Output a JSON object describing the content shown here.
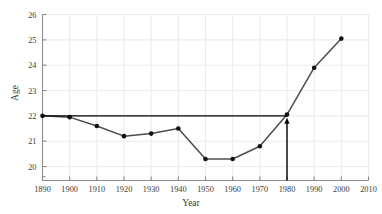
{
  "chart_data": {
    "type": "line",
    "title": "",
    "xlabel": "Year",
    "ylabel": "Age",
    "xlim": [
      1890,
      2010
    ],
    "ylim": [
      19.45,
      26
    ],
    "grid": true,
    "legend": "none",
    "x": [
      1890,
      1900,
      1910,
      1920,
      1930,
      1940,
      1950,
      1960,
      1970,
      1980,
      1990,
      2000
    ],
    "values": [
      22.0,
      21.95,
      21.6,
      21.2,
      21.3,
      21.5,
      20.3,
      20.3,
      20.8,
      22.05,
      23.9,
      25.05
    ],
    "series": [
      {
        "name": "Age",
        "values": [
          22.0,
          21.95,
          21.6,
          21.2,
          21.3,
          21.5,
          20.3,
          20.3,
          20.8,
          22.05,
          23.9,
          25.05
        ],
        "color": "#4d4d4d",
        "marker": "filled-circle",
        "marker_color": "#111111"
      }
    ],
    "xticks": [
      1890,
      1900,
      1910,
      1920,
      1930,
      1940,
      1950,
      1960,
      1970,
      1980,
      1990,
      2000,
      2010
    ],
    "xticklabels": [
      "1890",
      "1900",
      "1910",
      "1920",
      "1930",
      "1940",
      "1950",
      "1960",
      "1970",
      "1980",
      "1990",
      "2000",
      "2010"
    ],
    "yticks": [
      20,
      21,
      22,
      23,
      24,
      25,
      26
    ],
    "yticklabels": [
      "20",
      "21",
      "22",
      "23",
      "24",
      "25",
      "26"
    ],
    "annotations": [
      {
        "name": "reference-line-horizontal",
        "type": "hline",
        "y": 22.0,
        "x_start": 1890,
        "x_end": 1980,
        "color": "#000000",
        "width": 1.4
      },
      {
        "name": "reference-arrow-vertical",
        "type": "arrow",
        "x": 1980,
        "y_start": 19.45,
        "y_end": 21.75,
        "color": "#000000",
        "width": 1.4,
        "head": "up"
      }
    ],
    "colors": {
      "line": "#4d4d4d",
      "marker": "#111111",
      "grid": "#ececec",
      "axis": "#8c8c8c",
      "text": "#3a3a3a",
      "background": "#ffffff",
      "annotation": "#000000"
    }
  }
}
